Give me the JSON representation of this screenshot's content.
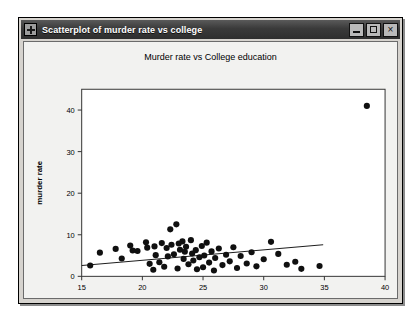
{
  "window": {
    "title": "Scatterplot of murder rate vs college",
    "icon": "move-crosshair-icon",
    "buttons": {
      "minimize_label": "_",
      "maximize_label": "□",
      "close_label": "×"
    }
  },
  "chart_data": {
    "type": "scatter",
    "title": "Murder rate vs College education",
    "xlabel": "college",
    "ylabel": "murder rate",
    "xlim": [
      15,
      40
    ],
    "ylim": [
      0,
      45
    ],
    "xticks": [
      15,
      20,
      25,
      30,
      35,
      40
    ],
    "yticks": [
      0,
      10,
      20,
      30,
      40
    ],
    "grid": false,
    "legend": null,
    "marker": {
      "shape": "circle",
      "color": "#101010",
      "size": 3.1
    },
    "points": [
      {
        "x": 15.7,
        "y": 2.6
      },
      {
        "x": 16.5,
        "y": 5.7
      },
      {
        "x": 17.8,
        "y": 6.6
      },
      {
        "x": 18.3,
        "y": 4.3
      },
      {
        "x": 19.0,
        "y": 7.4
      },
      {
        "x": 19.2,
        "y": 6.2
      },
      {
        "x": 19.6,
        "y": 6.1
      },
      {
        "x": 20.3,
        "y": 8.2
      },
      {
        "x": 20.4,
        "y": 6.9
      },
      {
        "x": 20.6,
        "y": 3.0
      },
      {
        "x": 20.9,
        "y": 1.6
      },
      {
        "x": 21.0,
        "y": 7.2
      },
      {
        "x": 21.1,
        "y": 5.1
      },
      {
        "x": 21.4,
        "y": 3.4
      },
      {
        "x": 21.6,
        "y": 8.0
      },
      {
        "x": 21.8,
        "y": 2.3
      },
      {
        "x": 22.0,
        "y": 6.8
      },
      {
        "x": 22.1,
        "y": 4.8
      },
      {
        "x": 22.3,
        "y": 11.3
      },
      {
        "x": 22.4,
        "y": 7.6
      },
      {
        "x": 22.6,
        "y": 5.3
      },
      {
        "x": 22.8,
        "y": 12.5
      },
      {
        "x": 22.9,
        "y": 1.9
      },
      {
        "x": 23.0,
        "y": 7.9
      },
      {
        "x": 23.1,
        "y": 6.4
      },
      {
        "x": 23.3,
        "y": 8.4
      },
      {
        "x": 23.4,
        "y": 4.2
      },
      {
        "x": 23.5,
        "y": 5.9
      },
      {
        "x": 23.6,
        "y": 7.1
      },
      {
        "x": 23.8,
        "y": 2.9
      },
      {
        "x": 24.0,
        "y": 8.7
      },
      {
        "x": 24.1,
        "y": 5.5
      },
      {
        "x": 24.2,
        "y": 3.8
      },
      {
        "x": 24.4,
        "y": 6.3
      },
      {
        "x": 24.5,
        "y": 1.7
      },
      {
        "x": 24.7,
        "y": 4.6
      },
      {
        "x": 24.9,
        "y": 7.3
      },
      {
        "x": 25.0,
        "y": 2.2
      },
      {
        "x": 25.1,
        "y": 5.0
      },
      {
        "x": 25.3,
        "y": 8.1
      },
      {
        "x": 25.5,
        "y": 3.3
      },
      {
        "x": 25.7,
        "y": 6.0
      },
      {
        "x": 25.9,
        "y": 1.4
      },
      {
        "x": 26.0,
        "y": 4.4
      },
      {
        "x": 26.3,
        "y": 6.7
      },
      {
        "x": 26.6,
        "y": 2.7
      },
      {
        "x": 26.9,
        "y": 5.2
      },
      {
        "x": 27.2,
        "y": 3.6
      },
      {
        "x": 27.5,
        "y": 7.0
      },
      {
        "x": 27.8,
        "y": 2.0
      },
      {
        "x": 28.1,
        "y": 4.9
      },
      {
        "x": 28.6,
        "y": 3.1
      },
      {
        "x": 29.0,
        "y": 5.8
      },
      {
        "x": 29.4,
        "y": 2.4
      },
      {
        "x": 30.0,
        "y": 4.1
      },
      {
        "x": 30.6,
        "y": 8.3
      },
      {
        "x": 31.2,
        "y": 5.4
      },
      {
        "x": 31.9,
        "y": 2.8
      },
      {
        "x": 32.6,
        "y": 3.5
      },
      {
        "x": 33.1,
        "y": 1.8
      },
      {
        "x": 34.6,
        "y": 2.5
      },
      {
        "x": 38.5,
        "y": 41.0
      }
    ],
    "fit_line": {
      "label": "least-squares fit",
      "x_start": 15.0,
      "y_start": 2.6,
      "x_end": 34.9,
      "y_end": 7.6,
      "color": "#1a1a1a"
    }
  }
}
